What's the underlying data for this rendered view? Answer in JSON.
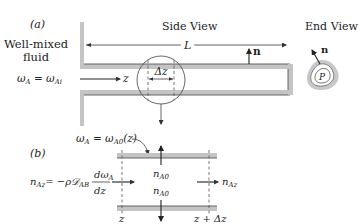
{
  "figure": {
    "part_a": {
      "label": "(a)",
      "side_view_title": "Side View",
      "end_view_title": "End View",
      "fluid_label_line1": "Well-mixed",
      "fluid_label_line2": "fluid",
      "inlet_condition": "ω_A = ω_Ai",
      "inlet_lhs": "ω",
      "inlet_lhs_sub": "A",
      "inlet_rhs": "ω",
      "inlet_rhs_sub": "Ai",
      "axis_label": "z",
      "length_label": "L",
      "element_label": "Δz",
      "normal_label": "n",
      "perimeter_label": "P"
    },
    "part_b": {
      "label": "(b)",
      "wall_condition": "ω_A = ω_A0(z)",
      "wall_lhs": "ω",
      "wall_lhs_sub": "A",
      "wall_rhs": "ω",
      "wall_rhs_sub": "A0",
      "wall_rhs_arg": "(z)",
      "flux_eq_lhs": "n",
      "flux_eq_lhs_sub": "Az",
      "flux_eq_mid": "= −ρ",
      "flux_eq_D": "𝒟",
      "flux_eq_D_sub": "AB",
      "flux_num": "dω",
      "flux_num_sub": "A",
      "flux_den": "dz",
      "wall_flux_top": "n",
      "wall_flux_top_sub": "A0",
      "wall_flux_bottom": "n",
      "wall_flux_bottom_sub": "A0",
      "outlet_flux": "n",
      "outlet_flux_sub": "Az",
      "left_bound": "z",
      "right_bound": "z + Δz"
    }
  }
}
